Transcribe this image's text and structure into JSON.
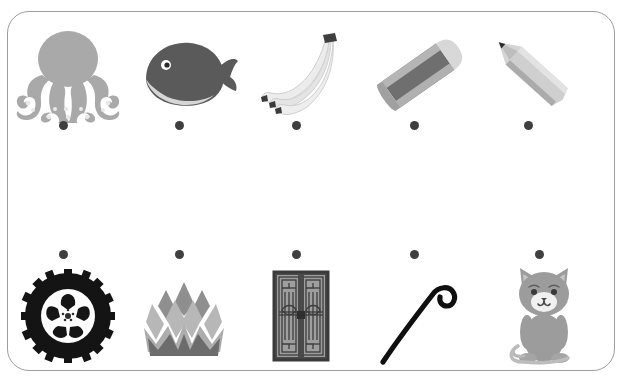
{
  "worksheet": {
    "title": "Picture matching worksheet",
    "border_color": "#9d9d9d",
    "background_color": "#ffffff",
    "dot_color": "#3f3f3f",
    "rows": [
      {
        "name": "top-row",
        "dot_position": "below",
        "items": [
          {
            "label": "octopus",
            "icon": "octopus-icon",
            "x": 7,
            "y": 18,
            "dot_x": 62,
            "dot_y": 124,
            "color": "#a3a3a3"
          },
          {
            "label": "whale",
            "icon": "whale-icon",
            "x": 123,
            "y": 18,
            "dot_x": 178,
            "dot_y": 124,
            "color": "#575757"
          },
          {
            "label": "bananas",
            "icon": "bananas-icon",
            "x": 240,
            "y": 18,
            "dot_x": 295,
            "dot_y": 124,
            "color": "#e3e3e3"
          },
          {
            "label": "eraser",
            "icon": "eraser-icon",
            "x": 358,
            "y": 18,
            "dot_x": 413,
            "dot_y": 124,
            "color": "#8e8e8e"
          },
          {
            "label": "pencil",
            "icon": "pencil-icon",
            "x": 472,
            "y": 18,
            "dot_x": 527,
            "dot_y": 124,
            "color": "#bdbdbd"
          }
        ]
      },
      {
        "name": "bottom-row",
        "dot_position": "above",
        "items": [
          {
            "label": "tyre",
            "icon": "tyre-icon",
            "x": 7,
            "y": 249,
            "dot_x": 62,
            "dot_y": 253,
            "color": "#1a1a1a"
          },
          {
            "label": "lotus",
            "icon": "lotus-icon",
            "x": 123,
            "y": 249,
            "dot_x": 178,
            "dot_y": 253,
            "color": "#a8a8a8"
          },
          {
            "label": "window",
            "icon": "window-icon",
            "x": 240,
            "y": 249,
            "dot_x": 295,
            "dot_y": 253,
            "color": "#4a4a4a"
          },
          {
            "label": "walking-stick",
            "icon": "walking-stick-icon",
            "x": 358,
            "y": 249,
            "dot_x": 413,
            "dot_y": 253,
            "color": "#111111"
          },
          {
            "label": "cat",
            "icon": "cat-icon",
            "x": 483,
            "y": 249,
            "dot_x": 538,
            "dot_y": 253,
            "color": "#9a9a9a"
          }
        ]
      }
    ]
  }
}
